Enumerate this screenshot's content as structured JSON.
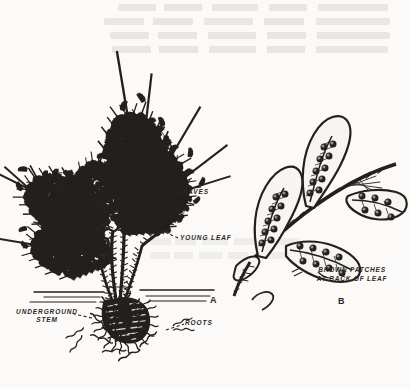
{
  "figure": {
    "kind": "botanical-line-engraving",
    "background_color": "#fbfaf8",
    "ink_color": "#23201d",
    "bleed_through_note": "faint mirror-image text showing through from reverse of page"
  },
  "panels": [
    {
      "id": "A",
      "letter": "A",
      "description": "whole fern plant with fronds, young coiled leaves, underground stem and roots"
    },
    {
      "id": "B",
      "letter": "B",
      "description": "detail of leaf underside pinnae bearing rows of round brown spore patches (sori)"
    }
  ],
  "labels": [
    {
      "name": "leaves",
      "text": "LEAVES"
    },
    {
      "name": "young-leaf",
      "text": "YOUNG LEAF"
    },
    {
      "name": "underground-stem",
      "line1": "UNDERGROUND",
      "line2": "STEM"
    },
    {
      "name": "roots",
      "text": "ROOTS"
    }
  ],
  "captions": [
    {
      "name": "brown-patches",
      "line1": "BROWN PATCHES",
      "line2": "AT BACK OF LEAF"
    }
  ]
}
